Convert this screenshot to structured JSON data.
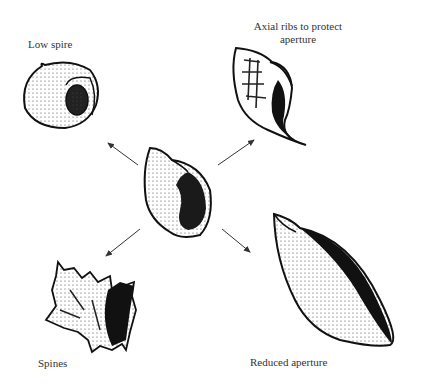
{
  "diagram": {
    "center_shell": "Ancestral shell",
    "labels": {
      "low_spire": "Low spire",
      "axial_ribs_line1": "Axial ribs to protect",
      "axial_ribs_line2": "aperture",
      "spines": "Spines",
      "reduced_aperture": "Reduced aperture"
    },
    "arrows": [
      "up-left",
      "up-right",
      "down-left",
      "down-right"
    ],
    "colors": {
      "ink": "#1a1a1a",
      "text": "#333333",
      "background": "#ffffff"
    }
  }
}
